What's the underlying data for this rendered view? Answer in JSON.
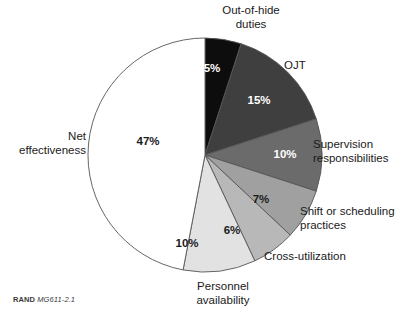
{
  "figure": {
    "source_note_prefix": "RAND",
    "source_note_id": "MG611-2.1"
  },
  "chart_data": {
    "type": "pie",
    "title": "",
    "subtitle": "",
    "xlabel": "",
    "ylabel": "",
    "legend_position": "none",
    "grid": false,
    "start_angle_deg": 0,
    "direction": "clockwise",
    "center": {
      "x": 205,
      "y": 155
    },
    "radius": 117,
    "units": "percent",
    "total": 100,
    "categories": [
      "Out-of-hide duties",
      "OJT",
      "Supervision responsibilities",
      "Shift or scheduling practices",
      "Cross-utilization",
      "Personnel availability",
      "Net effectiveness"
    ],
    "values": [
      5,
      15,
      10,
      7,
      6,
      10,
      47
    ],
    "value_labels": [
      "5%",
      "15%",
      "10%",
      "7%",
      "6%",
      "10%",
      "47%"
    ],
    "colors": [
      "#0d0d0d",
      "#3f3f3f",
      "#6b6b6b",
      "#a0a0a0",
      "#b8b8b8",
      "#e2e2e2",
      "#ffffff"
    ],
    "label_text_colors": [
      "#ffffff",
      "#ffffff",
      "#ffffff",
      "#1a1a1a",
      "#1a1a1a",
      "#1a1a1a",
      "#1a1a1a"
    ],
    "outline_color": "#555555",
    "slices": [
      {
        "label": "Out-of-hide duties",
        "label_display": "Out-of-hide\nduties",
        "value": 5,
        "value_label": "5%",
        "color": "#0d0d0d",
        "label_x": 212,
        "label_y": 69
      },
      {
        "label": "OJT",
        "label_display": "OJT",
        "value": 15,
        "value_label": "15%",
        "color": "#3f3f3f",
        "label_x": 259,
        "label_y": 101
      },
      {
        "label": "Supervision responsibilities",
        "label_display": "Supervision\nresponsibilities",
        "value": 10,
        "value_label": "10%",
        "color": "#6b6b6b",
        "label_x": 285,
        "label_y": 155
      },
      {
        "label": "Shift or scheduling practices",
        "label_display": "Shift or scheduling\npractices",
        "value": 7,
        "value_label": "7%",
        "color": "#a0a0a0",
        "label_x": 261,
        "label_y": 200
      },
      {
        "label": "Cross-utilization",
        "label_display": "Cross-utilization",
        "value": 6,
        "value_label": "6%",
        "color": "#b8b8b8",
        "label_x": 232,
        "label_y": 231
      },
      {
        "label": "Personnel availability",
        "label_display": "Personnel\navailability",
        "value": 10,
        "value_label": "10%",
        "color": "#e2e2e2",
        "label_x": 187,
        "label_y": 244
      },
      {
        "label": "Net effectiveness",
        "label_display": "Net\neffectiveness",
        "value": 47,
        "value_label": "47%",
        "color": "#ffffff",
        "label_x": 148,
        "label_y": 142
      }
    ]
  }
}
